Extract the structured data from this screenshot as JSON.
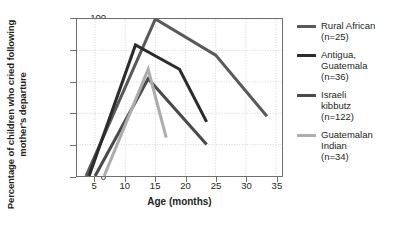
{
  "chart_data": {
    "type": "line",
    "title": "",
    "xlabel": "Age (months)",
    "ylabel": "Percentage of children who\ncried following mother's departure",
    "xlim": [
      2,
      36
    ],
    "ylim": [
      0,
      100
    ],
    "xticks": [
      5,
      10,
      15,
      20,
      25,
      30,
      35
    ],
    "yticks": [
      0,
      20,
      40,
      60,
      80,
      100
    ],
    "grid": "dotted",
    "legend_position": "right",
    "series": [
      {
        "name": "Rural African",
        "n": "n=25",
        "label": "Rural African\n(n=25)",
        "color": "#595959",
        "points": [
          [
            3.5,
            0
          ],
          [
            15.0,
            100
          ],
          [
            25.0,
            77
          ],
          [
            33.5,
            38
          ]
        ]
      },
      {
        "name": "Antigua, Guatemala",
        "n": "n=36",
        "label": "Antigua,\nGuatemala\n(n=36)",
        "color": "#2b2b2b",
        "points": [
          [
            4.0,
            0
          ],
          [
            11.7,
            83.5
          ],
          [
            19.0,
            68
          ],
          [
            23.5,
            34.5
          ]
        ]
      },
      {
        "name": "Israeli kibbutz",
        "n": "n=122",
        "label": "Israeli\nkibbutz\n(n=122)",
        "color": "#4a4a4a",
        "points": [
          [
            5.0,
            0
          ],
          [
            13.8,
            62
          ],
          [
            23.5,
            20
          ]
        ]
      },
      {
        "name": "Guatemalan Indian",
        "n": "n=34",
        "label": "Guatemalan\nIndian\n(n=34)",
        "color": "#adadad",
        "points": [
          [
            6.5,
            0
          ],
          [
            13.8,
            68
          ],
          [
            16.8,
            24.5
          ]
        ]
      }
    ]
  },
  "axis": {
    "frame_color": "#6f6f6f",
    "grid_color": "#c9c9c9"
  }
}
